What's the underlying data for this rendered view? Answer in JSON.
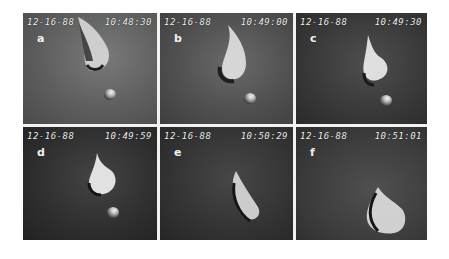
{
  "figure": {
    "panels": [
      {
        "label": "a",
        "date": "12-16-88",
        "time": "10:48:30"
      },
      {
        "label": "b",
        "date": "12-16-88",
        "time": "10:49:00"
      },
      {
        "label": "c",
        "date": "12-16-88",
        "time": "10:49:30"
      },
      {
        "label": "d",
        "date": "12-16-88",
        "time": "10:49:59"
      },
      {
        "label": "e",
        "date": "12-16-88",
        "time": "10:50:29"
      },
      {
        "label": "f",
        "date": "12-16-88",
        "time": "10:51:01"
      }
    ]
  }
}
